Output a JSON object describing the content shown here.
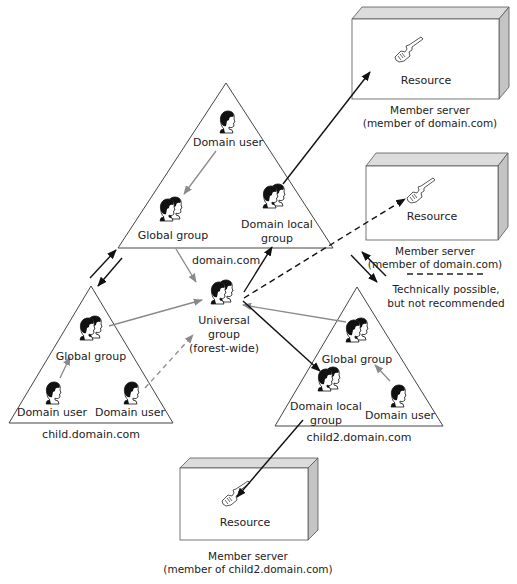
{
  "diagram": {
    "domains": {
      "root": {
        "name": "domain.com",
        "domain_user": "Domain user",
        "global_group": "Global group",
        "domain_local_group_line1": "Domain local",
        "domain_local_group_line2": "group"
      },
      "child": {
        "name": "child.domain.com",
        "global_group": "Global group",
        "domain_user_left": "Domain user",
        "domain_user_right": "Domain user"
      },
      "child2": {
        "name": "child2.domain.com",
        "global_group": "Global group",
        "domain_local_group_line1": "Domain local",
        "domain_local_group_line2": "group",
        "domain_user": "Domain user"
      }
    },
    "universal_group": {
      "line1": "Universal",
      "line2": "group",
      "line3": "(forest-wide)"
    },
    "servers": [
      {
        "resource": "Resource",
        "caption_line1": "Member server",
        "caption_line2": "(member of domain.com)"
      },
      {
        "resource": "Resource",
        "caption_line1": "Member server",
        "caption_line2": "(member of domain.com)"
      },
      {
        "resource": "Resource",
        "caption_line1": "Member server",
        "caption_line2": "(member of child2.domain.com)"
      }
    ],
    "legend": {
      "line1": "Technically possible,",
      "line2": "but not recommended",
      "style": "dashed"
    },
    "icons": {
      "user": "user-head-icon",
      "group": "group-heads-icon",
      "resource": "key-icon"
    },
    "colors": {
      "black_arrow": "#111111",
      "gray_arrow": "#8a8a8a",
      "server_side": "#c8c8c8",
      "server_top": "#dcdcdc"
    }
  }
}
